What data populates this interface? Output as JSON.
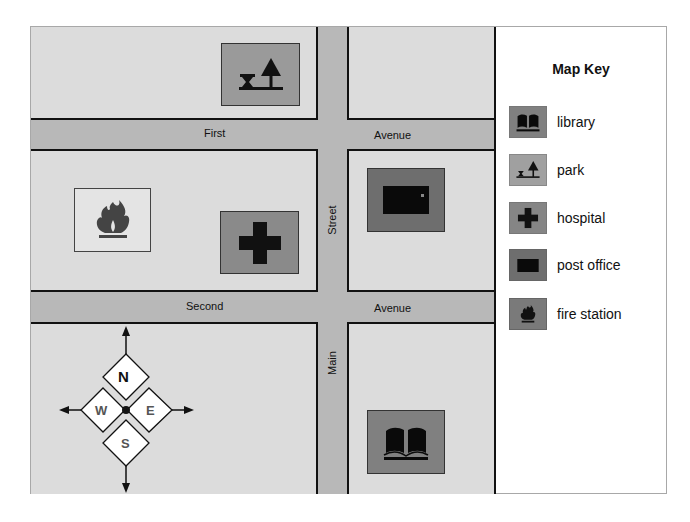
{
  "colors": {
    "block": "#dcdcdc",
    "road": "#b8b8b8",
    "poi_park": "#9a9a9a",
    "poi_hospital": "#8a8a8a",
    "poi_post_office": "#6e6e6e",
    "poi_library": "#808080",
    "poi_fire_station": "#e4e4e4",
    "ink": "#111111"
  },
  "roads": {
    "first_avenue": {
      "left_word": "First",
      "right_word": "Avenue"
    },
    "second_avenue": {
      "left_word": "Second",
      "right_word": "Avenue"
    },
    "main_street": {
      "top_word": "Street",
      "bottom_word": "Main"
    }
  },
  "places": [
    {
      "name": "park",
      "icon": "park-icon"
    },
    {
      "name": "fire station",
      "icon": "fire-icon"
    },
    {
      "name": "hospital",
      "icon": "hospital-cross-icon"
    },
    {
      "name": "post office",
      "icon": "mailbox-icon"
    },
    {
      "name": "library",
      "icon": "open-book-icon"
    }
  ],
  "compass": {
    "north": "N",
    "south": "S",
    "east": "E",
    "west": "W"
  },
  "legend": {
    "title": "Map Key",
    "items": [
      {
        "label": "library",
        "icon": "open-book-icon"
      },
      {
        "label": "park",
        "icon": "park-icon"
      },
      {
        "label": "hospital",
        "icon": "hospital-cross-icon"
      },
      {
        "label": "post office",
        "icon": "mailbox-icon"
      },
      {
        "label": "fire station",
        "icon": "fire-icon"
      }
    ]
  }
}
